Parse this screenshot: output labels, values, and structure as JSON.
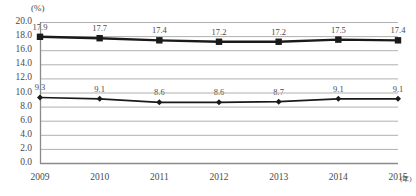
{
  "chart_data": {
    "type": "line",
    "title": "",
    "xlabel": "(年)",
    "ylabel": "(%)",
    "categories": [
      "2009",
      "2010",
      "2011",
      "2012",
      "2013",
      "2014",
      "2015"
    ],
    "ylim": [
      0.0,
      20.0
    ],
    "ytick_step": 2.0,
    "yticks": [
      "20.0",
      "18.0",
      "16.0",
      "14.0",
      "12.0",
      "10.0",
      "8.0",
      "6.0",
      "4.0",
      "2.0",
      "0.0"
    ],
    "grid": true,
    "legend": "none",
    "series": [
      {
        "name": "series-upper",
        "marker": "square",
        "color": "#1a1a1a",
        "values": [
          17.9,
          17.7,
          17.4,
          17.2,
          17.2,
          17.5,
          17.4
        ],
        "labels": [
          "17.9",
          "17.7",
          "17.4",
          "17.2",
          "17.2",
          "17.5",
          "17.4"
        ]
      },
      {
        "name": "series-lower",
        "marker": "diamond",
        "color": "#1a1a1a",
        "values": [
          9.3,
          9.1,
          8.6,
          8.6,
          8.7,
          9.1,
          9.1
        ],
        "labels": [
          "9.3",
          "9.1",
          "8.6",
          "8.6",
          "8.7",
          "9.1",
          "9.1"
        ]
      }
    ],
    "colors": {
      "grid": "#b0b0b0",
      "axis": "#8a8a8a",
      "line": "#1a1a1a",
      "text": "#4a4a4a",
      "background": "#ffffff"
    }
  }
}
